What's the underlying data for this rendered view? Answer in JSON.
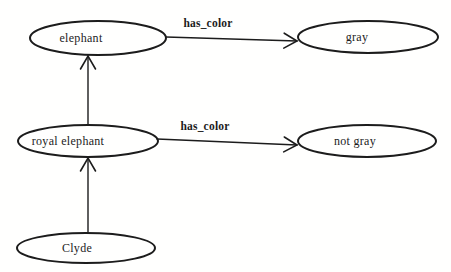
{
  "diagram": {
    "type": "semantic-network",
    "background": "#fffffe",
    "ink": "#1c1c1c",
    "node_font_size": 12,
    "edge_font_size": 11.5,
    "nodes": [
      {
        "id": "elephant",
        "label": "elephant",
        "cx": 98,
        "cy": 38,
        "rx": 68,
        "ry": 17,
        "label_x": 81,
        "label_y": 42
      },
      {
        "id": "gray",
        "label": "gray",
        "cx": 368,
        "cy": 37,
        "rx": 70,
        "ry": 16,
        "label_x": 357,
        "label_y": 41
      },
      {
        "id": "royal-elephant",
        "label": "royal elephant",
        "cx": 88,
        "cy": 141,
        "rx": 70,
        "ry": 16,
        "label_x": 68,
        "label_y": 145
      },
      {
        "id": "not-gray",
        "label": "not gray",
        "cx": 367,
        "cy": 141,
        "rx": 69,
        "ry": 16,
        "label_x": 355,
        "label_y": 145
      },
      {
        "id": "clyde",
        "label": "Clyde",
        "cx": 86,
        "cy": 248,
        "rx": 69,
        "ry": 15,
        "label_x": 77,
        "label_y": 252
      }
    ],
    "edges": [
      {
        "id": "elephant-to-gray",
        "from": "elephant",
        "to": "gray",
        "label": "has_color",
        "x1": 166,
        "y1": 37,
        "x2": 297,
        "y2": 41,
        "label_x": 208,
        "label_y": 27
      },
      {
        "id": "royal-elephant-to-not-gray",
        "from": "royal-elephant",
        "to": "not-gray",
        "label": "has_color",
        "x1": 157,
        "y1": 139,
        "x2": 297,
        "y2": 145,
        "label_x": 205,
        "label_y": 130
      },
      {
        "id": "royal-elephant-to-elephant",
        "from": "royal-elephant",
        "to": "elephant",
        "label": "",
        "x1": 88,
        "y1": 125,
        "x2": 88,
        "y2": 56,
        "label_x": 0,
        "label_y": 0
      },
      {
        "id": "clyde-to-royal-elephant",
        "from": "clyde",
        "to": "royal-elephant",
        "label": "",
        "x1": 88,
        "y1": 232,
        "x2": 88,
        "y2": 158,
        "label_x": 0,
        "label_y": 0
      }
    ]
  }
}
